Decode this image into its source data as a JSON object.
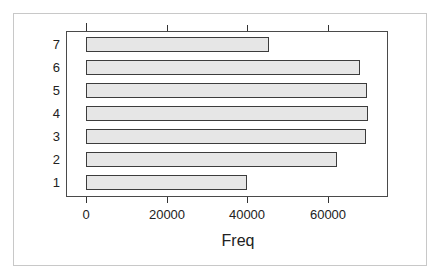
{
  "chart_data": {
    "type": "bar",
    "orientation": "horizontal",
    "title": "",
    "xlabel": "Freq",
    "ylabel": "",
    "categories": [
      "1",
      "2",
      "3",
      "4",
      "5",
      "6",
      "7"
    ],
    "values": [
      40000,
      62400,
      69600,
      70100,
      69800,
      68100,
      45500
    ],
    "xlim": [
      -5000,
      75000
    ],
    "x_ticks": [
      0,
      20000,
      40000,
      60000
    ],
    "x_tick_labels": [
      "0",
      "20000",
      "40000",
      "60000"
    ],
    "grid": false,
    "legend": null,
    "bar_fill": "#e6e6e6",
    "bar_stroke": "#3c3c3c"
  }
}
